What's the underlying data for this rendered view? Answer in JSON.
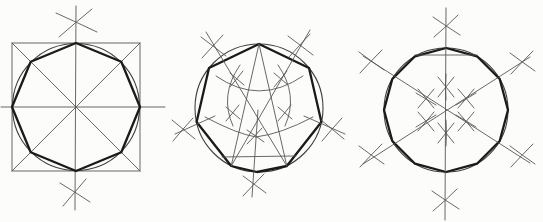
{
  "meta": {
    "background_color": "#fcfcfa",
    "thin_line_color": "#575757",
    "medium_line_color": "#3f3f3f",
    "thick_line_color": "#1a1a1a",
    "canvas_width": 543,
    "canvas_height": 222
  },
  "figures": [
    {
      "name": "octagon-in-square-construction",
      "polygon_sides": 8,
      "center": [
        76,
        107
      ],
      "radius": 64,
      "shapes": [
        {
          "name": "construction-square",
          "kind": "rect",
          "x": 12,
          "y": 43,
          "wd": 128,
          "ht": 128,
          "w": "thin"
        },
        {
          "name": "square-diagonal-1",
          "kind": "line",
          "x1": 12,
          "y1": 43,
          "x2": 140,
          "y2": 171,
          "w": "thin"
        },
        {
          "name": "square-diagonal-2",
          "kind": "line",
          "x1": 140,
          "y1": 43,
          "x2": 12,
          "y2": 171,
          "w": "thin"
        },
        {
          "name": "horizontal-centerline",
          "kind": "line",
          "x1": 1,
          "y1": 107,
          "x2": 165,
          "y2": 107,
          "w": "thin"
        },
        {
          "name": "vertical-centerline",
          "kind": "line",
          "x1": 76,
          "y1": 6,
          "x2": 75,
          "y2": 210,
          "w": "thin"
        },
        {
          "name": "inscribed-circle",
          "kind": "circle",
          "cx": 76,
          "cy": 107,
          "r": 63.5,
          "w": "med"
        },
        {
          "name": "octagon-outline",
          "kind": "polygon",
          "points": "76,43 121.3,61.7 140,107 121.3,152.3 76,171 30.7,152.3 12,107 30.7,61.7",
          "w": "thick"
        },
        {
          "name": "compass-arc-cross-top-a",
          "kind": "path",
          "d": "M56,13 Q76,22 97,32",
          "w": "thin"
        },
        {
          "name": "compass-arc-cross-top-b",
          "kind": "path",
          "d": "M92,9 Q75,23 59,37",
          "w": "thin"
        },
        {
          "name": "compass-arc-cross-bottom-a",
          "kind": "path",
          "d": "M60,183 Q75,192 90,202",
          "w": "thin"
        },
        {
          "name": "compass-arc-cross-bottom-b",
          "kind": "path",
          "d": "M86,179 Q74,193 63,206",
          "w": "thin"
        }
      ]
    },
    {
      "name": "heptagon-construction",
      "polygon_sides": 7,
      "center": [
        259,
        108
      ],
      "radius": 64,
      "shapes": [
        {
          "name": "circumscribed-circle",
          "kind": "circle",
          "cx": 259,
          "cy": 108,
          "r": 64,
          "w": "med"
        },
        {
          "name": "heptagon-outline",
          "kind": "polygon",
          "points": "259,44 309,68 321.4,122 286.8,166 257,172 231.2,166 196.6,122 209,68",
          "w": "thick"
        },
        {
          "name": "chord-apex-to-lower-left",
          "kind": "line",
          "x1": 259,
          "y1": 44,
          "x2": 231.2,
          "y2": 166,
          "w": "thin"
        },
        {
          "name": "chord-apex-to-lower-right",
          "kind": "line",
          "x1": 259,
          "y1": 44,
          "x2": 286.8,
          "y2": 166,
          "w": "thin"
        },
        {
          "name": "diagonal-upper-left-to-lower-right",
          "kind": "line",
          "x1": 206,
          "y1": 32,
          "x2": 286.8,
          "y2": 166,
          "w": "thin"
        },
        {
          "name": "diagonal-upper-right-to-lower-left",
          "kind": "line",
          "x1": 310,
          "y1": 30,
          "x2": 231.2,
          "y2": 166,
          "w": "thin"
        },
        {
          "name": "left-extension-line",
          "kind": "line",
          "x1": 175,
          "y1": 134,
          "x2": 215,
          "y2": 116,
          "w": "thin"
        },
        {
          "name": "right-extension-line",
          "kind": "line",
          "x1": 304,
          "y1": 116,
          "x2": 345,
          "y2": 134,
          "w": "thin"
        },
        {
          "name": "bottom-chord",
          "kind": "line",
          "x1": 222,
          "y1": 157,
          "x2": 296,
          "y2": 156,
          "w": "thin"
        },
        {
          "name": "vertical-drop-line",
          "kind": "line",
          "x1": 258,
          "y1": 110,
          "x2": 252,
          "y2": 197,
          "w": "thin"
        },
        {
          "name": "compass-cross-upper-left-a",
          "kind": "path",
          "d": "M201,37 Q213,46 226,56",
          "w": "thin"
        },
        {
          "name": "compass-cross-upper-left-b",
          "kind": "path",
          "d": "M223,35 Q212,47 202,58",
          "w": "thin"
        },
        {
          "name": "compass-cross-upper-right-a",
          "kind": "path",
          "d": "M288,36 Q300,45 313,55",
          "w": "thin"
        },
        {
          "name": "compass-cross-upper-right-b",
          "kind": "path",
          "d": "M310,34 Q299,46 289,57",
          "w": "thin"
        },
        {
          "name": "compass-cross-left-a",
          "kind": "path",
          "d": "M172,120 Q183,129 195,139",
          "w": "thin"
        },
        {
          "name": "compass-cross-left-b",
          "kind": "path",
          "d": "M193,118 Q182,130 173,141",
          "w": "thin"
        },
        {
          "name": "compass-cross-right-a",
          "kind": "path",
          "d": "M321,120 Q332,129 344,139",
          "w": "thin"
        },
        {
          "name": "compass-cross-right-b",
          "kind": "path",
          "d": "M342,118 Q331,130 322,141",
          "w": "thin"
        },
        {
          "name": "compass-cross-bottom-a",
          "kind": "path",
          "d": "M243,176 Q254,184 266,193",
          "w": "thin"
        },
        {
          "name": "compass-cross-bottom-b",
          "kind": "path",
          "d": "M264,174 Q253,185 243,196",
          "w": "thin"
        },
        {
          "name": "interior-arc-smile",
          "kind": "path",
          "d": "M216,76 Q259,106 303,76",
          "w": "thin"
        },
        {
          "name": "interior-arc-left-petal",
          "kind": "path",
          "d": "M240,65 Q219,95 233,126",
          "w": "thin"
        },
        {
          "name": "interior-arc-right-petal",
          "kind": "path",
          "d": "M278,65 Q299,95 285,126",
          "w": "thin"
        },
        {
          "name": "interior-arc-lower-left",
          "kind": "path",
          "d": "M205,117 Q237,134 256,137",
          "w": "thin"
        },
        {
          "name": "interior-arc-lower-right",
          "kind": "path",
          "d": "M313,117 Q281,134 256,137",
          "w": "thin"
        },
        {
          "name": "tick-cross-1a",
          "kind": "path",
          "d": "M230,73 Q237,79 244,85",
          "w": "thin"
        },
        {
          "name": "tick-cross-1b",
          "kind": "path",
          "d": "M243,71 Q236,80 230,87",
          "w": "thin"
        },
        {
          "name": "tick-cross-2a",
          "kind": "path",
          "d": "M274,73 Q281,79 288,85",
          "w": "thin"
        },
        {
          "name": "tick-cross-2b",
          "kind": "path",
          "d": "M287,71 Q280,80 274,87",
          "w": "thin"
        },
        {
          "name": "tick-cross-3a",
          "kind": "path",
          "d": "M226,107 Q233,113 240,119",
          "w": "thin"
        },
        {
          "name": "tick-cross-3b",
          "kind": "path",
          "d": "M239,105 Q232,114 226,121",
          "w": "thin"
        },
        {
          "name": "tick-cross-4a",
          "kind": "path",
          "d": "M278,107 Q285,113 292,119",
          "w": "thin"
        },
        {
          "name": "tick-cross-4b",
          "kind": "path",
          "d": "M291,105 Q284,114 278,121",
          "w": "thin"
        },
        {
          "name": "tick-cross-5a",
          "kind": "path",
          "d": "M247,130 Q256,136 264,142",
          "w": "thin"
        },
        {
          "name": "tick-cross-5b",
          "kind": "path",
          "d": "M262,128 Q254,137 247,144",
          "w": "thin"
        }
      ]
    },
    {
      "name": "dodecagon-construction",
      "polygon_sides": 12,
      "center": [
        446,
        110
      ],
      "radius": 62,
      "shapes": [
        {
          "name": "circumscribed-circle",
          "kind": "circle",
          "cx": 446,
          "cy": 110,
          "r": 62,
          "w": "med"
        },
        {
          "name": "dodecagon-outline",
          "kind": "polygon",
          "points": "446,48 477,56.3 499.7,79 508,110 499.7,141 477,163.7 446,172 415,163.7 392.3,141 384,110 392.3,79 415,56.3",
          "w": "thick"
        },
        {
          "name": "top-chord",
          "kind": "line",
          "x1": 415,
          "y1": 55,
          "x2": 477,
          "y2": 55,
          "w": "thin"
        },
        {
          "name": "vertical-axis",
          "kind": "line",
          "x1": 446,
          "y1": 8,
          "x2": 445,
          "y2": 220,
          "w": "thin"
        },
        {
          "name": "diagonal-axis-1",
          "kind": "line",
          "x1": 363,
          "y1": 56,
          "x2": 530,
          "y2": 163,
          "w": "thin"
        },
        {
          "name": "diagonal-axis-2",
          "kind": "line",
          "x1": 363,
          "y1": 164,
          "x2": 530,
          "y2": 57,
          "w": "thin"
        },
        {
          "name": "compass-cross-top-a",
          "kind": "path",
          "d": "M433,17 Q446,26 460,35",
          "w": "thin"
        },
        {
          "name": "compass-cross-top-b",
          "kind": "path",
          "d": "M458,15 Q446,27 434,37",
          "w": "thin"
        },
        {
          "name": "compass-cross-bottom-a",
          "kind": "path",
          "d": "M432,191 Q445,200 459,209",
          "w": "thin"
        },
        {
          "name": "compass-cross-bottom-b",
          "kind": "path",
          "d": "M457,189 Q445,201 433,211",
          "w": "thin"
        },
        {
          "name": "compass-cross-upper-left-a",
          "kind": "path",
          "d": "M359,52 Q371,61 384,70",
          "w": "thin"
        },
        {
          "name": "compass-cross-upper-left-b",
          "kind": "path",
          "d": "M382,50 Q370,62 360,73",
          "w": "thin"
        },
        {
          "name": "compass-cross-upper-right-a",
          "kind": "path",
          "d": "M510,53 Q522,62 535,71",
          "w": "thin"
        },
        {
          "name": "compass-cross-upper-right-b",
          "kind": "path",
          "d": "M533,51 Q521,63 511,74",
          "w": "thin"
        },
        {
          "name": "compass-cross-lower-left-a",
          "kind": "path",
          "d": "M359,146 Q371,155 384,164",
          "w": "thin"
        },
        {
          "name": "compass-cross-lower-left-b",
          "kind": "path",
          "d": "M382,144 Q370,156 360,167",
          "w": "thin"
        },
        {
          "name": "compass-cross-lower-right-a",
          "kind": "path",
          "d": "M510,146 Q522,155 535,164",
          "w": "thin"
        },
        {
          "name": "compass-cross-lower-right-b",
          "kind": "path",
          "d": "M533,144 Q521,156 511,167",
          "w": "thin"
        },
        {
          "name": "ring-mark-top-a",
          "kind": "path",
          "d": "M438,77 Q446,87 454,97",
          "w": "thin"
        },
        {
          "name": "ring-mark-top-b",
          "kind": "path",
          "d": "M454,77 Q446,87 438,97",
          "w": "thin"
        },
        {
          "name": "ring-mark-top-c",
          "kind": "path",
          "d": "M446,74 Q445,87 446,100",
          "w": "thin"
        },
        {
          "name": "ring-mark-bottom-a",
          "kind": "path",
          "d": "M438,123 Q446,133 454,143",
          "w": "thin"
        },
        {
          "name": "ring-mark-bottom-b",
          "kind": "path",
          "d": "M454,123 Q446,133 438,143",
          "w": "thin"
        },
        {
          "name": "ring-mark-bottom-c",
          "kind": "path",
          "d": "M446,120 Q447,133 446,146",
          "w": "thin"
        },
        {
          "name": "ring-mark-upper-right-a",
          "kind": "path",
          "d": "M458,89 Q466,98 474,108",
          "w": "thin"
        },
        {
          "name": "ring-mark-upper-right-b",
          "kind": "path",
          "d": "M474,89 Q466,99 458,108",
          "w": "thin"
        },
        {
          "name": "ring-mark-upper-right-c",
          "kind": "path",
          "d": "M476,93 Q466,99 456,105",
          "w": "thin"
        },
        {
          "name": "ring-mark-upper-left-a",
          "kind": "path",
          "d": "M418,89 Q426,98 434,108",
          "w": "thin"
        },
        {
          "name": "ring-mark-upper-left-b",
          "kind": "path",
          "d": "M434,89 Q426,99 418,108",
          "w": "thin"
        },
        {
          "name": "ring-mark-upper-left-c",
          "kind": "path",
          "d": "M416,93 Q426,99 436,105",
          "w": "thin"
        },
        {
          "name": "ring-mark-lower-right-a",
          "kind": "path",
          "d": "M458,112 Q466,121 474,131",
          "w": "thin"
        },
        {
          "name": "ring-mark-lower-right-b",
          "kind": "path",
          "d": "M474,112 Q466,122 458,131",
          "w": "thin"
        },
        {
          "name": "ring-mark-lower-right-c",
          "kind": "path",
          "d": "M476,127 Q466,121 456,115",
          "w": "thin"
        },
        {
          "name": "ring-mark-lower-left-a",
          "kind": "path",
          "d": "M418,112 Q426,121 434,131",
          "w": "thin"
        },
        {
          "name": "ring-mark-lower-left-b",
          "kind": "path",
          "d": "M434,112 Q426,122 418,131",
          "w": "thin"
        },
        {
          "name": "ring-mark-lower-left-c",
          "kind": "path",
          "d": "M416,127 Q426,121 436,115",
          "w": "thin"
        }
      ]
    }
  ]
}
